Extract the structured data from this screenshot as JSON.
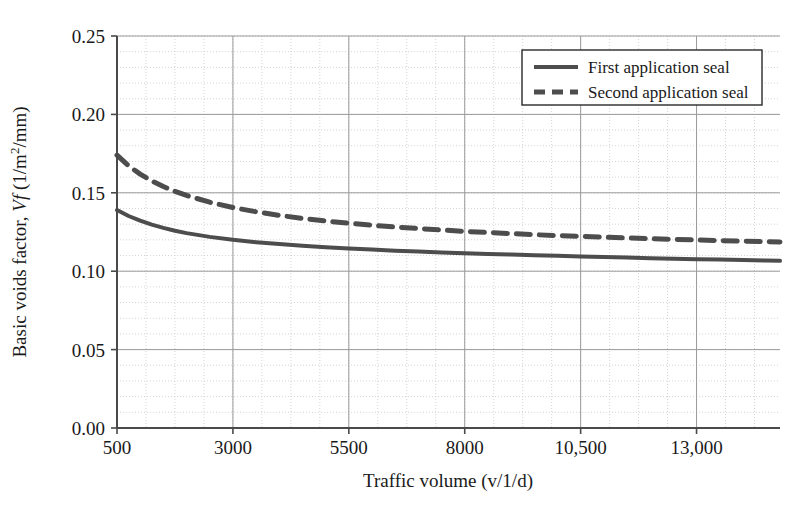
{
  "chart_data": {
    "type": "line",
    "title": "",
    "xlabel": "Traffic volume (v/1/d)",
    "ylabel_prefix": "Basic voids factor, ",
    "ylabel_symbol": "Vf",
    "ylabel_units": " (1/m2/mm)",
    "ylabel_units_base": " (1/m",
    "ylabel_units_sup": "2",
    "ylabel_units_tail": "/mm)",
    "ylabel_full": "Basic voids factor, Vf (1/m2/mm)",
    "xlim": [
      500,
      14800
    ],
    "ylim": [
      0.0,
      0.25
    ],
    "x_ticks": [
      500,
      3000,
      5500,
      8000,
      10500,
      13000
    ],
    "x_tick_labels": [
      "500",
      "3000",
      "5500",
      "8000",
      "10,500",
      "13,000"
    ],
    "y_ticks": [
      0.0,
      0.05,
      0.1,
      0.15,
      0.2,
      0.25
    ],
    "y_tick_labels": [
      "0.00",
      "0.05",
      "0.10",
      "0.15",
      "0.20",
      "0.25"
    ],
    "x_minor_step": 625,
    "y_minor_step": 0.01,
    "grid": true,
    "grid_major_color": "#9a9a9a",
    "grid_minor_color": "#c9c9c9",
    "axis_color": "#4a4a4a",
    "legend_position": "top-right",
    "series": [
      {
        "name": "First application seal",
        "style": "solid",
        "color": "#4d4d4d",
        "width": 4.0,
        "x": [
          500,
          750,
          1000,
          1250,
          1500,
          1750,
          2000,
          2500,
          3000,
          3500,
          4000,
          4500,
          5000,
          5500,
          6000,
          6500,
          7000,
          7500,
          8000,
          8500,
          9000,
          9500,
          10000,
          10500,
          11000,
          11500,
          12000,
          12500,
          13000,
          13500,
          14000,
          14500,
          14800
        ],
        "y": [
          0.139,
          0.1352,
          0.1322,
          0.1297,
          0.1276,
          0.1258,
          0.1243,
          0.1219,
          0.12,
          0.1185,
          0.1173,
          0.1162,
          0.1153,
          0.1145,
          0.1138,
          0.1131,
          0.1125,
          0.112,
          0.1115,
          0.111,
          0.1106,
          0.1102,
          0.1098,
          0.1094,
          0.109,
          0.1087,
          0.1083,
          0.108,
          0.1077,
          0.1074,
          0.1071,
          0.1068,
          0.1066
        ]
      },
      {
        "name": "Second application seal",
        "style": "dashed",
        "color": "#4d4d4d",
        "width": 5.0,
        "dash": "14,9",
        "x": [
          500,
          750,
          1000,
          1250,
          1500,
          1750,
          2000,
          2500,
          3000,
          3500,
          4000,
          4500,
          5000,
          5500,
          6000,
          6500,
          7000,
          7500,
          8000,
          8500,
          9000,
          9500,
          10000,
          10500,
          11000,
          11500,
          12000,
          12500,
          13000,
          13500,
          14000,
          14500,
          14800
        ],
        "y": [
          0.174,
          0.1672,
          0.1619,
          0.1576,
          0.154,
          0.1509,
          0.1483,
          0.144,
          0.1406,
          0.1379,
          0.1356,
          0.1337,
          0.132,
          0.1306,
          0.1293,
          0.1282,
          0.1272,
          0.1263,
          0.1254,
          0.1247,
          0.124,
          0.1233,
          0.1227,
          0.1222,
          0.1217,
          0.1212,
          0.1207,
          0.1203,
          0.1199,
          0.1195,
          0.1191,
          0.1188,
          0.1186
        ]
      }
    ],
    "legend": [
      {
        "label": "First application seal",
        "style": "solid"
      },
      {
        "label": "Second application seal",
        "style": "dashed"
      }
    ]
  }
}
